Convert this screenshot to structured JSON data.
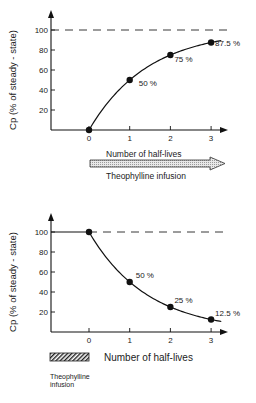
{
  "chart_data": [
    {
      "type": "line",
      "title": "",
      "ylabel": "Cp (% of steady - state)",
      "xlabel": "Number of half-lives",
      "ylim": [
        0,
        100
      ],
      "xlim": [
        0,
        3
      ],
      "yticks": [
        "20",
        "40",
        "60",
        "80",
        "100"
      ],
      "xticks": [
        "0",
        "1",
        "2",
        "3"
      ],
      "reference_line": {
        "y": 100,
        "style": "dashed"
      },
      "series": [
        {
          "name": "Accumulation",
          "x": [
            0,
            1,
            2,
            3
          ],
          "y": [
            0,
            50,
            75,
            87.5
          ]
        }
      ],
      "annotations": [
        "50 %",
        "75 %",
        "87.5 %"
      ],
      "infusion_bar": {
        "label": "Theophylline infusion",
        "span": "0 to beyond 3 half-lives (arrow)"
      }
    },
    {
      "type": "line",
      "title": "",
      "ylabel": "Cp (% of steady - state)",
      "xlabel": "Number of half-lives",
      "ylim": [
        0,
        100
      ],
      "xlim": [
        0,
        3
      ],
      "yticks": [
        "20",
        "40",
        "60",
        "80",
        "100"
      ],
      "xticks": [
        "0",
        "1",
        "2",
        "3"
      ],
      "reference_line": {
        "y": 100,
        "style": "dashed"
      },
      "series": [
        {
          "name": "Elimination",
          "x": [
            0,
            1,
            2,
            3
          ],
          "y": [
            100,
            50,
            25,
            12.5
          ]
        }
      ],
      "annotations": [
        "50 %",
        "25 %",
        "12.5 %"
      ],
      "infusion_bar": {
        "label": "Theophylline infusion",
        "span": "before 0 half-lives"
      }
    }
  ]
}
